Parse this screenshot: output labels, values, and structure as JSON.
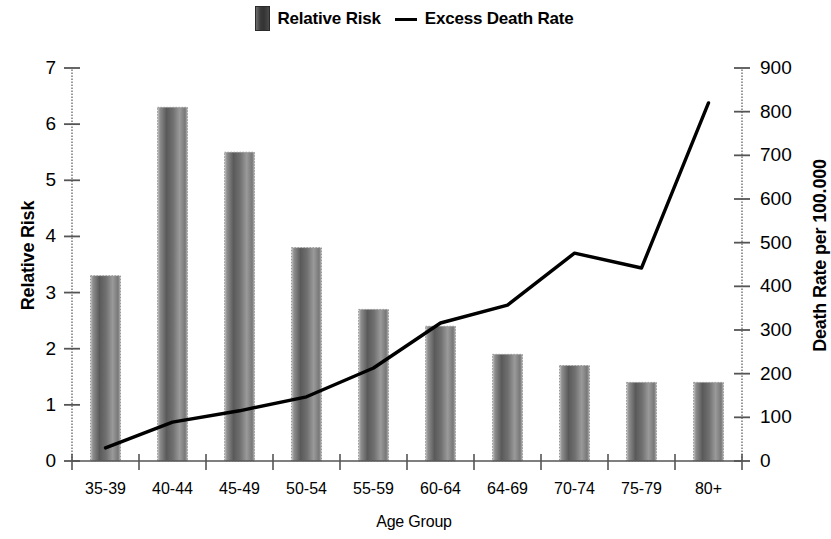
{
  "legend": {
    "bar_series_label": "Relative Risk",
    "line_series_label": "Excess Death Rate"
  },
  "axes": {
    "x_title": "Age Group",
    "y_left_title": "Relative Risk",
    "y_right_title": "Death Rate per 100.000",
    "y_left_ticks": [
      "7",
      "6",
      "5",
      "4",
      "3",
      "2",
      "1",
      "0"
    ],
    "y_right_ticks": [
      "900",
      "800",
      "700",
      "600",
      "500",
      "400",
      "300",
      "200",
      "100",
      "0"
    ]
  },
  "colors": {
    "bar_dark": "#3c3c3c",
    "bar_mid": "#6b6b6b",
    "bar_light": "#b9b9b9",
    "line": "#000000",
    "axis": "#555555",
    "background": "#ffffff"
  },
  "chart_data": {
    "type": "bar",
    "title": "",
    "xlabel": "Age Group",
    "ylabel": "Relative Risk",
    "y2label": "Death Rate per 100.000",
    "categories": [
      "35-39",
      "40-44",
      "45-49",
      "50-54",
      "55-59",
      "60-64",
      "64-69",
      "70-74",
      "75-79",
      "80+"
    ],
    "ylim": [
      0,
      7
    ],
    "y2lim": [
      0,
      900
    ],
    "grid": false,
    "legend_position": "top-center",
    "series": [
      {
        "name": "Relative Risk",
        "type": "bar",
        "axis": "left",
        "values": [
          3.3,
          6.3,
          5.5,
          3.8,
          2.7,
          2.4,
          1.9,
          1.7,
          1.4,
          1.4
        ]
      },
      {
        "name": "Excess Death Rate",
        "type": "line",
        "axis": "right",
        "values": [
          30,
          89,
          115,
          147,
          213,
          316,
          357,
          476,
          442,
          820
        ]
      }
    ]
  }
}
